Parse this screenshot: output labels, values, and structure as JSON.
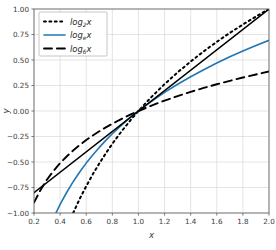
{
  "chart_data": {
    "type": "line",
    "title": "",
    "xlabel": "x",
    "ylabel": "y",
    "xlim": [
      0.2,
      2.0
    ],
    "ylim": [
      -1.0,
      1.0
    ],
    "xticks": [
      "0.2",
      "0.4",
      "0.6",
      "0.8",
      "1.0",
      "1.2",
      "1.4",
      "1.6",
      "1.8",
      "2.0"
    ],
    "xtick_values": [
      0.2,
      0.4,
      0.6,
      0.8,
      1.0,
      1.2,
      1.4,
      1.6,
      1.8,
      2.0
    ],
    "yticks": [
      "−1.00",
      "−0.75",
      "−0.50",
      "−0.25",
      "0.00",
      "0.25",
      "0.50",
      "0.75",
      "1.00"
    ],
    "ytick_values": [
      -1.0,
      -0.75,
      -0.5,
      -0.25,
      0.0,
      0.25,
      0.5,
      0.75,
      1.0
    ],
    "grid": true,
    "grid_color": "#d8d8d8",
    "background": "#ffffff",
    "legend_position": "upper left",
    "series": [
      {
        "name": "log_2 x",
        "label_base": "log",
        "label_sub": "2",
        "label_arg": "x",
        "style": "dotted",
        "color": "#000000",
        "x": [
          0.5,
          0.55,
          0.6,
          0.65,
          0.7,
          0.75,
          0.8,
          0.85,
          0.9,
          0.95,
          1.0,
          1.05,
          1.1,
          1.2,
          1.3,
          1.4,
          1.5,
          1.6,
          1.7,
          1.8,
          1.9,
          2.0
        ],
        "y": [
          -1.0,
          -0.862,
          -0.737,
          -0.621,
          -0.515,
          -0.415,
          -0.322,
          -0.234,
          -0.152,
          -0.074,
          0.0,
          0.07,
          0.138,
          0.263,
          0.379,
          0.485,
          0.585,
          0.678,
          0.766,
          0.848,
          0.926,
          1.0
        ]
      },
      {
        "name": "log_e x",
        "label_base": "log",
        "label_sub": "e",
        "label_arg": "x",
        "style": "solid",
        "color": "#1f77b4",
        "x": [
          0.368,
          0.4,
          0.45,
          0.5,
          0.55,
          0.6,
          0.65,
          0.7,
          0.75,
          0.8,
          0.85,
          0.9,
          0.95,
          1.0,
          1.05,
          1.1,
          1.2,
          1.3,
          1.4,
          1.5,
          1.6,
          1.7,
          1.8,
          1.9,
          2.0
        ],
        "y": [
          -1.0,
          -0.916,
          -0.799,
          -0.693,
          -0.598,
          -0.511,
          -0.431,
          -0.357,
          -0.288,
          -0.223,
          -0.163,
          -0.105,
          -0.051,
          0.0,
          0.049,
          0.095,
          0.182,
          0.262,
          0.336,
          0.405,
          0.47,
          0.531,
          0.588,
          0.642,
          0.693
        ]
      },
      {
        "name": "log_6 x",
        "label_base": "log",
        "label_sub": "6",
        "label_arg": "x",
        "style": "dashed",
        "color": "#000000",
        "x": [
          0.2,
          0.25,
          0.3,
          0.35,
          0.4,
          0.45,
          0.5,
          0.55,
          0.6,
          0.65,
          0.7,
          0.75,
          0.8,
          0.85,
          0.9,
          0.95,
          1.0,
          1.1,
          1.2,
          1.3,
          1.4,
          1.5,
          1.6,
          1.7,
          1.8,
          1.9,
          2.0
        ],
        "y": [
          -0.898,
          -0.774,
          -0.672,
          -0.586,
          -0.511,
          -0.446,
          -0.387,
          -0.334,
          -0.285,
          -0.24,
          -0.199,
          -0.161,
          -0.125,
          -0.091,
          -0.059,
          -0.029,
          0.0,
          0.053,
          0.102,
          0.146,
          0.188,
          0.226,
          0.262,
          0.296,
          0.328,
          0.358,
          0.387
        ]
      },
      {
        "name": "y = x - 1",
        "label_base": "",
        "label_sub": "",
        "label_arg": "",
        "style": "solid",
        "color": "#000000",
        "in_legend": false,
        "x": [
          0.2,
          2.0
        ],
        "y": [
          -0.8,
          1.0
        ]
      }
    ],
    "legend_entries": [
      {
        "base": "log",
        "sub": "2",
        "arg": "x",
        "style": "dotted",
        "color": "#000000"
      },
      {
        "base": "log",
        "sub": "e",
        "arg": "x",
        "style": "solid",
        "color": "#1f77b4"
      },
      {
        "base": "log",
        "sub": "6",
        "arg": "x",
        "style": "dashed",
        "color": "#000000"
      }
    ]
  }
}
